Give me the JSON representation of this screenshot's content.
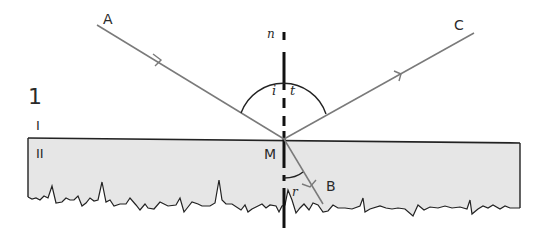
{
  "figure": {
    "number": "1"
  },
  "media": {
    "upper_label": "I",
    "lower_label": "II",
    "lower_fill": "#e6e6e6"
  },
  "points": {
    "A": "A",
    "B": "B",
    "C": "C",
    "M": "M"
  },
  "normal": {
    "label": "n"
  },
  "angles": {
    "incidence": "i",
    "reflection": "t",
    "refraction": "r"
  },
  "colors": {
    "ray": "#7a7a7a",
    "outline": "#222222",
    "normal": "#111111"
  }
}
